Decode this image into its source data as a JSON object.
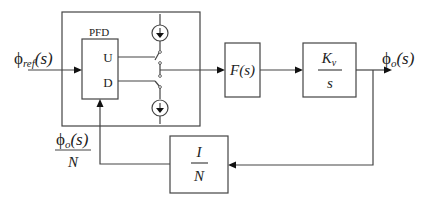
{
  "diagram": {
    "type": "block-diagram",
    "input": {
      "symbol": "ϕ",
      "subscript": "ref",
      "arg": "(s)"
    },
    "output": {
      "symbol": "ϕ",
      "subscript": "o",
      "arg": "(s)"
    },
    "feedback_signal": {
      "numerator_symbol": "ϕ",
      "numerator_subscript": "o",
      "numerator_arg": "(s)",
      "denominator": "N"
    },
    "blocks": {
      "charge_pump_group": {
        "label": ""
      },
      "pfd": {
        "label": "PFD",
        "up_label": "U",
        "down_label": "D"
      },
      "loop_filter": {
        "label": "F(s)"
      },
      "vco": {
        "numerator": "K",
        "numerator_subscript": "v",
        "denominator": "s"
      },
      "divider": {
        "numerator": "I",
        "denominator": "N"
      }
    },
    "components": {
      "up_current_source": "current-source-down",
      "down_current_source": "current-source-down",
      "up_switch": "switch",
      "down_switch": "switch"
    },
    "connections": [
      {
        "from": "input",
        "to": "pfd"
      },
      {
        "from": "pfd.U",
        "to": "up_switch"
      },
      {
        "from": "pfd.D",
        "to": "down_switch"
      },
      {
        "from": "charge_pump",
        "to": "loop_filter"
      },
      {
        "from": "loop_filter",
        "to": "vco"
      },
      {
        "from": "vco",
        "to": "output"
      },
      {
        "from": "output",
        "to": "divider"
      },
      {
        "from": "divider",
        "to": "pfd"
      }
    ],
    "colors": {
      "line": "#444444",
      "arrow": "#111111",
      "text": "#222222",
      "background": "#ffffff"
    }
  }
}
